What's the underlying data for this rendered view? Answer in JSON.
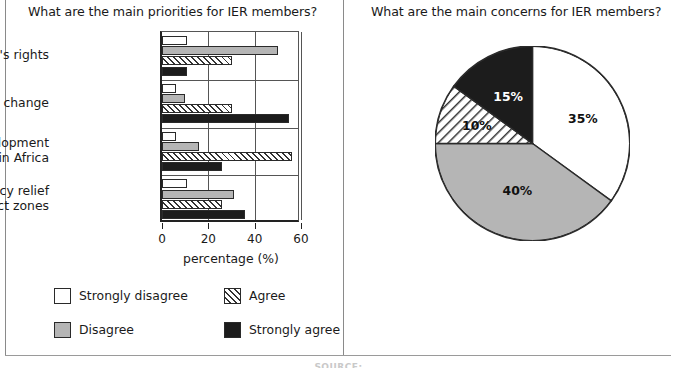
{
  "left_panel": {
    "title": "What are the main priorities for IER members?",
    "legend": [
      {
        "label": "Strongly disagree",
        "swatch": "white-square-icon",
        "color": "#ffffff"
      },
      {
        "label": "Agree",
        "swatch": "hatched-square-icon",
        "color": "#ffffff"
      },
      {
        "label": "Disagree",
        "swatch": "gray-square-icon",
        "color": "#b5b5b5"
      },
      {
        "label": "Strongly agree",
        "swatch": "black-square-icon",
        "color": "#1c1c1c"
      }
    ]
  },
  "right_panel": {
    "title": "What are the main concerns for IER members?",
    "legend": [
      {
        "label": "Efficiency/effectiveness",
        "swatch": "white-square-icon",
        "color": "#ffffff"
      },
      {
        "label": "Image",
        "swatch": "hatched-square-icon",
        "color": "#ffffff"
      },
      {
        "label": "Misuse of funds",
        "swatch": "gray-square-icon",
        "color": "#b5b5b5"
      },
      {
        "label": "Leadership",
        "swatch": "black-square-icon",
        "color": "#1c1c1c"
      }
    ]
  },
  "caption": "SOURCE:",
  "chart_data": [
    {
      "type": "bar",
      "orientation": "horizontal",
      "title": "What are the main priorities for IER members?",
      "xlabel": "percentage (%)",
      "ylabel": "",
      "xlim": [
        0,
        60
      ],
      "xticks": [
        0,
        20,
        40,
        60
      ],
      "grid": true,
      "legend_position": "below",
      "categories": [
        "Women's rights",
        "Climate change",
        "Underdevelopment\nin Africa",
        "Emergency relief\nin conflict zones"
      ],
      "series": [
        {
          "name": "Strongly disagree",
          "color": "#ffffff",
          "pattern": "solid",
          "values": [
            11,
            6,
            6,
            11
          ]
        },
        {
          "name": "Disagree",
          "color": "#b5b5b5",
          "pattern": "solid",
          "values": [
            50,
            10,
            16,
            31
          ]
        },
        {
          "name": "Agree",
          "color": "#ffffff",
          "pattern": "hatch",
          "values": [
            30,
            30,
            56,
            26
          ]
        },
        {
          "name": "Strongly agree",
          "color": "#1c1c1c",
          "pattern": "solid",
          "values": [
            11,
            55,
            26,
            36
          ]
        }
      ]
    },
    {
      "type": "pie",
      "title": "What are the main concerns for IER members?",
      "legend_position": "below",
      "start_angle_deg": 0,
      "direction": "clockwise",
      "labels": [
        "Efficiency/effectiveness",
        "Misuse of funds",
        "Image",
        "Leadership"
      ],
      "values": [
        35,
        40,
        10,
        15
      ],
      "display_labels": [
        "35%",
        "40%",
        "10%",
        "15%"
      ],
      "colors": [
        "#ffffff",
        "#b5b5b5",
        "#ffffff",
        "#1c1c1c"
      ],
      "patterns": [
        "solid",
        "solid",
        "hatch",
        "solid"
      ]
    }
  ]
}
